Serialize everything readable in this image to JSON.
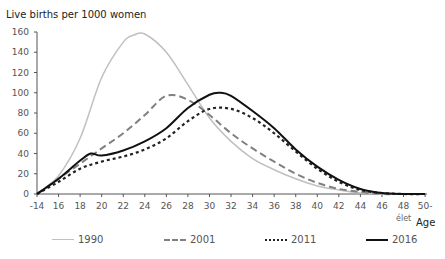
{
  "chart_data": {
    "type": "line",
    "title": "Live births per 1000 women",
    "xlabel": "Age",
    "xlabel_sub": "élet",
    "ylabel": "Live births per 1000 women",
    "ylim": [
      0,
      160
    ],
    "xlim": [
      14,
      50
    ],
    "grid": false,
    "legend_position": "bottom",
    "y_ticks": [
      "0",
      "20",
      "40",
      "60",
      "80",
      "100",
      "120",
      "140",
      "160"
    ],
    "x_ticks": [
      "-14",
      "16",
      "18",
      "20",
      "22",
      "24",
      "26",
      "28",
      "30",
      "32",
      "34",
      "36",
      "38",
      "40",
      "42",
      "44",
      "46",
      "48",
      "50-"
    ],
    "series": [
      {
        "name": "1990",
        "style": "solid",
        "color": "#c0c0c0",
        "width": 1.5,
        "x": [
          14,
          16,
          18,
          20,
          22,
          23,
          24,
          26,
          28,
          30,
          32,
          34,
          36,
          38,
          40,
          42,
          44,
          46,
          48,
          50
        ],
        "values": [
          0,
          18,
          55,
          115,
          150,
          157,
          158,
          140,
          108,
          75,
          52,
          35,
          24,
          15,
          8,
          4,
          1,
          0,
          0,
          0
        ]
      },
      {
        "name": "2001",
        "style": "dashed",
        "color": "#808080",
        "width": 2,
        "x": [
          14,
          16,
          18,
          20,
          22,
          24,
          26,
          28,
          30,
          32,
          34,
          36,
          38,
          40,
          42,
          44,
          46,
          48,
          50
        ],
        "values": [
          0,
          15,
          30,
          45,
          60,
          78,
          97,
          93,
          78,
          60,
          45,
          32,
          20,
          11,
          5,
          2,
          0,
          0,
          0
        ]
      },
      {
        "name": "2011",
        "style": "dotted",
        "color": "#222222",
        "width": 2.2,
        "x": [
          14,
          16,
          18,
          20,
          22,
          24,
          26,
          28,
          30,
          32,
          34,
          36,
          38,
          40,
          42,
          44,
          46,
          48,
          50
        ],
        "values": [
          0,
          12,
          25,
          32,
          37,
          44,
          55,
          72,
          84,
          84,
          75,
          60,
          42,
          25,
          12,
          4,
          1,
          0,
          0
        ]
      },
      {
        "name": "2016",
        "style": "solid",
        "color": "#111111",
        "width": 2,
        "x": [
          14,
          16,
          18,
          19,
          20,
          22,
          24,
          26,
          28,
          30,
          31,
          32,
          34,
          36,
          38,
          40,
          42,
          44,
          46,
          48,
          50
        ],
        "values": [
          0,
          15,
          33,
          40,
          38,
          43,
          52,
          65,
          85,
          98,
          100,
          97,
          82,
          65,
          44,
          27,
          14,
          5,
          1,
          0,
          0
        ]
      }
    ]
  },
  "legend": {
    "items": [
      {
        "label": "1990"
      },
      {
        "label": "2001"
      },
      {
        "label": "2011"
      },
      {
        "label": "2016"
      }
    ]
  }
}
